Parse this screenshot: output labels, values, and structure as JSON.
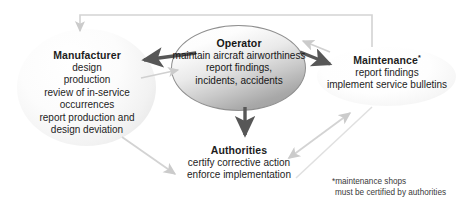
{
  "diagram": {
    "nodes": [
      {
        "id": "manufacturer",
        "name": "Manufacturer",
        "shape": "circle",
        "lines": [
          "design",
          "production",
          "review of in-service",
          "occurrences",
          "report production and",
          "design deviation"
        ]
      },
      {
        "id": "operator",
        "name": "Operator",
        "shape": "ellipse",
        "lines": [
          "maintain aircraft airworthiness",
          "report findings,",
          "incidents, accidents"
        ]
      },
      {
        "id": "maintenance",
        "name": "Maintenance",
        "name_marker": "*",
        "shape": "ellipse",
        "lines": [
          "report findings",
          "implement service bulletins"
        ]
      },
      {
        "id": "authorities",
        "name": "Authorities",
        "shape": "none",
        "lines": [
          "certify corrective action",
          "enforce implementation"
        ]
      }
    ],
    "footnote": {
      "marker": "*",
      "line1": "maintenance shops",
      "line2": "must be certified by authorities"
    },
    "connectors": [
      {
        "id": "operator-to-manufacturer",
        "from": "operator",
        "to": "manufacturer",
        "style": "solid-dark",
        "direction": "one-way"
      },
      {
        "id": "manufacturer-to-operator",
        "from": "manufacturer",
        "to": "operator",
        "style": "solid-light",
        "direction": "one-way"
      },
      {
        "id": "operator-to-maintenance",
        "from": "operator",
        "to": "maintenance",
        "style": "solid-dark",
        "direction": "one-way"
      },
      {
        "id": "maintenance-to-operator",
        "from": "maintenance",
        "to": "operator",
        "style": "solid-light",
        "direction": "one-way"
      },
      {
        "id": "operator-to-authorities",
        "from": "operator",
        "to": "authorities",
        "style": "solid-dark",
        "direction": "one-way"
      },
      {
        "id": "manufacturer-to-authorities",
        "from": "manufacturer",
        "to": "authorities",
        "style": "solid-light",
        "direction": "one-way"
      },
      {
        "id": "authorities-maintenance",
        "from": "authorities",
        "to": "maintenance",
        "style": "solid-light",
        "direction": "two-way"
      },
      {
        "id": "maintenance-to-manufacturer-top",
        "from": "maintenance",
        "to": "manufacturer",
        "style": "solid-light-elbow",
        "direction": "one-way"
      }
    ],
    "colors": {
      "arrow_dark": "#575757",
      "arrow_light": "#cfcfcf",
      "text": "#1d1d1d",
      "background": "#ffffff"
    }
  }
}
